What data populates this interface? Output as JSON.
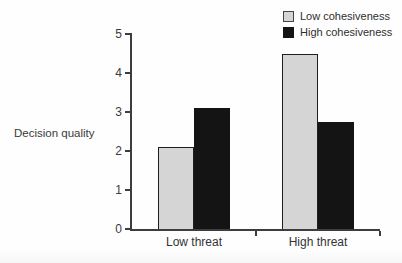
{
  "chart_data": {
    "type": "bar",
    "title": "",
    "xlabel": "",
    "ylabel": "Decision quality",
    "categories": [
      "Low threat",
      "High threat"
    ],
    "series": [
      {
        "name": "Low cohesiveness",
        "color": "#d5d5d5",
        "outlined": true,
        "values": [
          2.1,
          4.5
        ]
      },
      {
        "name": "High cohesiveness",
        "color": "#141414",
        "outlined": false,
        "values": [
          3.1,
          2.75
        ]
      }
    ],
    "ylim": [
      0,
      5
    ],
    "yticks": [
      0,
      1,
      2,
      3,
      4,
      5
    ],
    "grid": false,
    "legend_position": "top-right"
  },
  "style": {
    "axis_color": "#3d3d3d",
    "bar_outline_color": "#1f1f1f",
    "background": "#fefefe"
  }
}
